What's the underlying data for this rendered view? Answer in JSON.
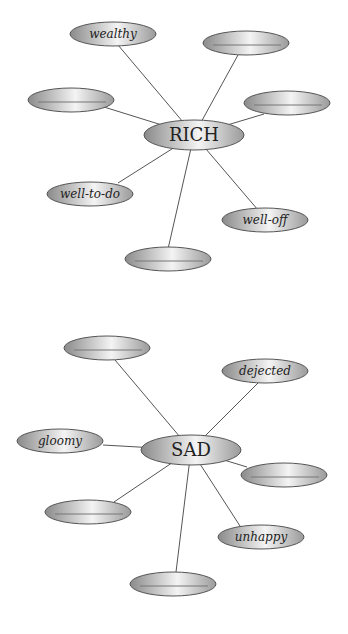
{
  "diagrams": [
    {
      "center": {
        "label": "RICH",
        "x": 194,
        "y": 135,
        "rx": 50,
        "ry": 15
      },
      "nodes": [
        {
          "label": "wealthy",
          "x": 113,
          "y": 34,
          "rx": 43,
          "ry": 12,
          "lx": 118,
          "ly": 45
        },
        {
          "label": "",
          "x": 246,
          "y": 43,
          "rx": 43,
          "ry": 12,
          "lx": 238,
          "ly": 55
        },
        {
          "label": "",
          "x": 71,
          "y": 100,
          "rx": 43,
          "ry": 12,
          "lx": 104,
          "ly": 107
        },
        {
          "label": "",
          "x": 287,
          "y": 103,
          "rx": 43,
          "ry": 12,
          "lx": 264,
          "ly": 114
        },
        {
          "label": "well-to-do",
          "x": 90,
          "y": 194,
          "rx": 43,
          "ry": 12,
          "lx": 118,
          "ly": 183
        },
        {
          "label": "well-off",
          "x": 265,
          "y": 220,
          "rx": 43,
          "ry": 12,
          "lx": 258,
          "ly": 210
        },
        {
          "label": "",
          "x": 168,
          "y": 259,
          "rx": 43,
          "ry": 12,
          "lx": 168,
          "ly": 249
        }
      ]
    },
    {
      "center": {
        "label": "SAD",
        "x": 191,
        "y": 450,
        "rx": 50,
        "ry": 15
      },
      "nodes": [
        {
          "label": "",
          "x": 107,
          "y": 348,
          "rx": 43,
          "ry": 12,
          "lx": 115,
          "ly": 360
        },
        {
          "label": "dejected",
          "x": 265,
          "y": 371,
          "rx": 43,
          "ry": 12,
          "lx": 258,
          "ly": 383
        },
        {
          "label": "gloomy",
          "x": 60,
          "y": 441,
          "rx": 43,
          "ry": 12,
          "lx": 103,
          "ly": 445
        },
        {
          "label": "",
          "x": 284,
          "y": 475,
          "rx": 43,
          "ry": 12,
          "lx": 247,
          "ly": 467
        },
        {
          "label": "",
          "x": 88,
          "y": 512,
          "rx": 43,
          "ry": 12,
          "lx": 114,
          "ly": 502
        },
        {
          "label": "unhappy",
          "x": 261,
          "y": 537,
          "rx": 43,
          "ry": 12,
          "lx": 240,
          "ly": 526
        },
        {
          "label": "",
          "x": 173,
          "y": 584,
          "rx": 43,
          "ry": 12,
          "lx": 176,
          "ly": 572
        }
      ]
    }
  ],
  "colors": {
    "ellipse_dark": "#8a8a8a",
    "ellipse_light": "#f2f2f2",
    "stroke": "#555555"
  }
}
